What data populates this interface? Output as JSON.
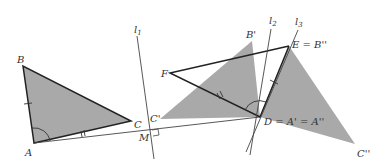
{
  "diagram": {
    "colors": {
      "fill": "#a9a9a9",
      "stroke": "#222222",
      "line": "#444444",
      "label": "#333333"
    },
    "points": {
      "A": {
        "label": "A",
        "x": 34,
        "y": 143
      },
      "B": {
        "label": "B",
        "x": 23,
        "y": 66
      },
      "C": {
        "label": "C",
        "x": 131,
        "y": 121
      },
      "M": {
        "label": "M",
        "x": 151,
        "y": 131
      },
      "C1": {
        "label": "C'",
        "x": 160,
        "y": 119
      },
      "B1": {
        "label": "B'",
        "x": 252,
        "y": 41
      },
      "F": {
        "label": "F",
        "x": 170,
        "y": 73
      },
      "E": {
        "label": "E = B''",
        "x": 289,
        "y": 46
      },
      "D": {
        "label": "D = A' = A''",
        "x": 260,
        "y": 117
      },
      "C2": {
        "label": "C''",
        "x": 355,
        "y": 144
      }
    },
    "lines": {
      "l1": {
        "label": "l",
        "sub": "1"
      },
      "l2": {
        "label": "l",
        "sub": "2"
      },
      "l3": {
        "label": "l",
        "sub": "3"
      }
    }
  }
}
